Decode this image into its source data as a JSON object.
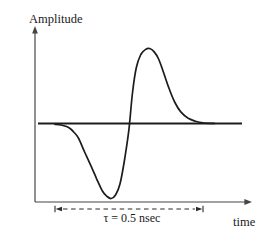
{
  "figure": {
    "y_axis_label": "Amplitude",
    "x_axis_label": "time",
    "duration_annotation": "τ = 0.5 nsec"
  },
  "colors": {
    "background": "#ffffff",
    "axis": "#454545",
    "baseline": "#1c1c1c",
    "curve": "#1c1c1c",
    "dimension": "#2b2b2b",
    "text": "#1a1a1a"
  },
  "chart_data": {
    "type": "line",
    "title": "",
    "xlabel": "time",
    "ylabel": "Amplitude",
    "x_units": "nsec",
    "y_units": "normalized amplitude",
    "annotation": "τ = 0.5 nsec",
    "annotated_span_nsec": 0.5,
    "xlim": [
      0,
      0.54
    ],
    "ylim": [
      -1,
      1
    ],
    "grid": false,
    "legend": false,
    "series": [
      {
        "name": "pulse-waveform",
        "points": [
          [
            0.0,
            -0.01
          ],
          [
            0.02,
            -0.02
          ],
          [
            0.045,
            -0.05
          ],
          [
            0.065,
            -0.12
          ],
          [
            0.08,
            -0.2
          ],
          [
            0.1,
            -0.38
          ],
          [
            0.12,
            -0.55
          ],
          [
            0.14,
            -0.73
          ],
          [
            0.16,
            -0.9
          ],
          [
            0.175,
            -0.97
          ],
          [
            0.19,
            -1.0
          ],
          [
            0.205,
            -0.95
          ],
          [
            0.22,
            -0.8
          ],
          [
            0.235,
            -0.48
          ],
          [
            0.25,
            -0.07
          ],
          [
            0.262,
            0.42
          ],
          [
            0.275,
            0.75
          ],
          [
            0.29,
            0.92
          ],
          [
            0.305,
            0.985
          ],
          [
            0.32,
            1.0
          ],
          [
            0.335,
            0.955
          ],
          [
            0.35,
            0.86
          ],
          [
            0.365,
            0.7
          ],
          [
            0.385,
            0.47
          ],
          [
            0.405,
            0.28
          ],
          [
            0.425,
            0.155
          ],
          [
            0.45,
            0.07
          ],
          [
            0.475,
            0.03
          ],
          [
            0.5,
            0.01
          ],
          [
            0.54,
            0.0
          ]
        ]
      }
    ]
  }
}
